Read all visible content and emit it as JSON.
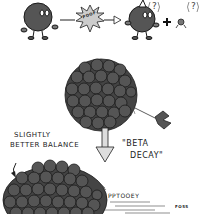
{
  "illustration": {
    "subject": "Beta decay cartoon",
    "panel_top": {
      "burst_text": "POOF",
      "plus_sign": "+",
      "question_marks": [
        "?",
        "?"
      ]
    },
    "panel_middle": {
      "labels": {
        "beta_line1": "\"BETA",
        "beta_line2": "DECAY\""
      }
    },
    "panel_bottom": {
      "labels": {
        "slightly": "SLIGHTLY",
        "better_balance": "BETTER BALANCE",
        "pptooey": "PPTOOEY",
        "signature": "FOSS"
      }
    },
    "colors": {
      "ball_fill": "#555555",
      "ball_stroke": "#1a1a1a",
      "burst_fill": "#cccccc",
      "background": "#ffffff"
    }
  }
}
